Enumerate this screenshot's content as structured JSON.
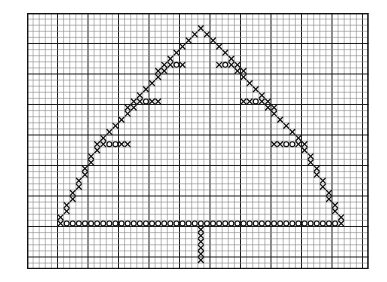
{
  "document": {
    "title": "Cross-Stitch Chart",
    "subject": "Christmas Tree",
    "medium": "graph-paper needlework chart",
    "background_color": "#ffffff"
  },
  "grid": {
    "origin_x": 27,
    "origin_y": 13,
    "cell_size": 6.1,
    "cols": 56,
    "rows": 42,
    "major_every": 5,
    "minor_color": "#8a8a8a",
    "major_color": "#1c1c1c",
    "border_color": "#111111",
    "show_border": true
  },
  "legend": {
    "symbols": [
      {
        "key": "x",
        "name": "cross-stitch-x",
        "glyph": "X",
        "color": "#0d0d0d"
      },
      {
        "key": "o",
        "name": "cross-stitch-o",
        "glyph": "O",
        "color": "#0d0d0d"
      }
    ]
  },
  "pattern": {
    "name": "christmas-tree",
    "description": "Outline of a conifer tree with zig-zag branch tiers, a stitched base row and a centered trunk.",
    "apex": {
      "col": 28,
      "row": 2
    },
    "base_row": 33,
    "base_left_col": 10,
    "base_right_col": 46,
    "trunk": {
      "col": 28,
      "top_row": 34,
      "bottom_row": 41,
      "width": 1
    },
    "cells": [
      {
        "c": 28,
        "r": 2,
        "s": "x"
      },
      {
        "c": 27,
        "r": 3,
        "s": "x"
      },
      {
        "c": 29,
        "r": 3,
        "s": "x"
      },
      {
        "c": 26,
        "r": 4,
        "s": "x"
      },
      {
        "c": 30,
        "r": 4,
        "s": "x"
      },
      {
        "c": 25,
        "r": 5,
        "s": "x"
      },
      {
        "c": 31,
        "r": 5,
        "s": "x"
      },
      {
        "c": 24,
        "r": 6,
        "s": "x"
      },
      {
        "c": 32,
        "r": 6,
        "s": "x"
      },
      {
        "c": 23,
        "r": 7,
        "s": "x"
      },
      {
        "c": 33,
        "r": 7,
        "s": "x"
      },
      {
        "c": 22,
        "r": 8,
        "s": "x"
      },
      {
        "c": 23,
        "r": 8,
        "s": "x"
      },
      {
        "c": 24,
        "r": 8,
        "s": "o"
      },
      {
        "c": 25,
        "r": 8,
        "s": "x"
      },
      {
        "c": 31,
        "r": 8,
        "s": "x"
      },
      {
        "c": 32,
        "r": 8,
        "s": "o"
      },
      {
        "c": 33,
        "r": 8,
        "s": "x"
      },
      {
        "c": 34,
        "r": 8,
        "s": "x"
      },
      {
        "c": 22,
        "r": 9,
        "s": "x"
      },
      {
        "c": 34,
        "r": 9,
        "s": "x"
      },
      {
        "c": 21,
        "r": 9,
        "s": "x"
      },
      {
        "c": 35,
        "r": 9,
        "s": "x"
      },
      {
        "c": 21,
        "r": 10,
        "s": "x"
      },
      {
        "c": 35,
        "r": 10,
        "s": "x"
      },
      {
        "c": 20,
        "r": 11,
        "s": "x"
      },
      {
        "c": 36,
        "r": 11,
        "s": "x"
      },
      {
        "c": 19,
        "r": 12,
        "s": "x"
      },
      {
        "c": 37,
        "r": 12,
        "s": "x"
      },
      {
        "c": 18,
        "r": 13,
        "s": "x"
      },
      {
        "c": 38,
        "r": 13,
        "s": "x"
      },
      {
        "c": 17,
        "r": 14,
        "s": "x"
      },
      {
        "c": 18,
        "r": 14,
        "s": "x"
      },
      {
        "c": 19,
        "r": 14,
        "s": "o"
      },
      {
        "c": 20,
        "r": 14,
        "s": "x"
      },
      {
        "c": 21,
        "r": 14,
        "s": "x"
      },
      {
        "c": 35,
        "r": 14,
        "s": "x"
      },
      {
        "c": 36,
        "r": 14,
        "s": "x"
      },
      {
        "c": 37,
        "r": 14,
        "s": "o"
      },
      {
        "c": 38,
        "r": 14,
        "s": "x"
      },
      {
        "c": 39,
        "r": 14,
        "s": "x"
      },
      {
        "c": 17,
        "r": 15,
        "s": "x"
      },
      {
        "c": 39,
        "r": 15,
        "s": "x"
      },
      {
        "c": 16,
        "r": 15,
        "s": "x"
      },
      {
        "c": 40,
        "r": 15,
        "s": "x"
      },
      {
        "c": 16,
        "r": 16,
        "s": "x"
      },
      {
        "c": 40,
        "r": 16,
        "s": "x"
      },
      {
        "c": 15,
        "r": 17,
        "s": "x"
      },
      {
        "c": 41,
        "r": 17,
        "s": "x"
      },
      {
        "c": 14,
        "r": 18,
        "s": "x"
      },
      {
        "c": 42,
        "r": 18,
        "s": "x"
      },
      {
        "c": 13,
        "r": 19,
        "s": "x"
      },
      {
        "c": 43,
        "r": 19,
        "s": "x"
      },
      {
        "c": 12,
        "r": 20,
        "s": "x"
      },
      {
        "c": 44,
        "r": 20,
        "s": "x"
      },
      {
        "c": 11,
        "r": 21,
        "s": "x"
      },
      {
        "c": 12,
        "r": 21,
        "s": "x"
      },
      {
        "c": 13,
        "r": 21,
        "s": "o"
      },
      {
        "c": 14,
        "r": 21,
        "s": "o"
      },
      {
        "c": 15,
        "r": 21,
        "s": "x"
      },
      {
        "c": 16,
        "r": 21,
        "s": "x"
      },
      {
        "c": 40,
        "r": 21,
        "s": "x"
      },
      {
        "c": 41,
        "r": 21,
        "s": "x"
      },
      {
        "c": 42,
        "r": 21,
        "s": "o"
      },
      {
        "c": 43,
        "r": 21,
        "s": "o"
      },
      {
        "c": 44,
        "r": 21,
        "s": "x"
      },
      {
        "c": 45,
        "r": 21,
        "s": "x"
      },
      {
        "c": 11,
        "r": 22,
        "s": "x"
      },
      {
        "c": 45,
        "r": 22,
        "s": "x"
      },
      {
        "c": 10,
        "r": 23,
        "s": "x"
      },
      {
        "c": 46,
        "r": 23,
        "s": "x"
      },
      {
        "c": 10,
        "r": 24,
        "s": "x"
      },
      {
        "c": 46,
        "r": 24,
        "s": "x"
      },
      {
        "c": 9,
        "r": 25,
        "s": "x"
      },
      {
        "c": 47,
        "r": 25,
        "s": "x"
      },
      {
        "c": 9,
        "r": 26,
        "s": "x"
      },
      {
        "c": 47,
        "r": 26,
        "s": "x"
      },
      {
        "c": 8,
        "r": 27,
        "s": "x"
      },
      {
        "c": 48,
        "r": 27,
        "s": "x"
      },
      {
        "c": 8,
        "r": 28,
        "s": "x"
      },
      {
        "c": 48,
        "r": 28,
        "s": "x"
      },
      {
        "c": 7,
        "r": 29,
        "s": "x"
      },
      {
        "c": 49,
        "r": 29,
        "s": "x"
      },
      {
        "c": 7,
        "r": 30,
        "s": "x"
      },
      {
        "c": 49,
        "r": 30,
        "s": "x"
      },
      {
        "c": 6,
        "r": 31,
        "s": "x"
      },
      {
        "c": 50,
        "r": 31,
        "s": "x"
      },
      {
        "c": 6,
        "r": 32,
        "s": "x"
      },
      {
        "c": 50,
        "r": 32,
        "s": "x"
      },
      {
        "c": 5,
        "r": 33,
        "s": "x"
      },
      {
        "c": 51,
        "r": 33,
        "s": "x"
      },
      {
        "c": 6,
        "r": 34,
        "s": "o"
      },
      {
        "c": 7,
        "r": 34,
        "s": "o"
      },
      {
        "c": 8,
        "r": 34,
        "s": "o"
      },
      {
        "c": 9,
        "r": 34,
        "s": "o"
      },
      {
        "c": 10,
        "r": 34,
        "s": "o"
      },
      {
        "c": 11,
        "r": 34,
        "s": "o"
      },
      {
        "c": 12,
        "r": 34,
        "s": "o"
      },
      {
        "c": 13,
        "r": 34,
        "s": "o"
      },
      {
        "c": 14,
        "r": 34,
        "s": "o"
      },
      {
        "c": 15,
        "r": 34,
        "s": "o"
      },
      {
        "c": 16,
        "r": 34,
        "s": "o"
      },
      {
        "c": 17,
        "r": 34,
        "s": "o"
      },
      {
        "c": 18,
        "r": 34,
        "s": "o"
      },
      {
        "c": 19,
        "r": 34,
        "s": "o"
      },
      {
        "c": 20,
        "r": 34,
        "s": "o"
      },
      {
        "c": 21,
        "r": 34,
        "s": "o"
      },
      {
        "c": 22,
        "r": 34,
        "s": "o"
      },
      {
        "c": 23,
        "r": 34,
        "s": "o"
      },
      {
        "c": 24,
        "r": 34,
        "s": "o"
      },
      {
        "c": 25,
        "r": 34,
        "s": "o"
      },
      {
        "c": 26,
        "r": 34,
        "s": "o"
      },
      {
        "c": 27,
        "r": 34,
        "s": "o"
      },
      {
        "c": 28,
        "r": 34,
        "s": "o"
      },
      {
        "c": 29,
        "r": 34,
        "s": "o"
      },
      {
        "c": 30,
        "r": 34,
        "s": "o"
      },
      {
        "c": 31,
        "r": 34,
        "s": "o"
      },
      {
        "c": 32,
        "r": 34,
        "s": "o"
      },
      {
        "c": 33,
        "r": 34,
        "s": "o"
      },
      {
        "c": 34,
        "r": 34,
        "s": "o"
      },
      {
        "c": 35,
        "r": 34,
        "s": "o"
      },
      {
        "c": 36,
        "r": 34,
        "s": "o"
      },
      {
        "c": 37,
        "r": 34,
        "s": "o"
      },
      {
        "c": 38,
        "r": 34,
        "s": "o"
      },
      {
        "c": 39,
        "r": 34,
        "s": "o"
      },
      {
        "c": 40,
        "r": 34,
        "s": "o"
      },
      {
        "c": 41,
        "r": 34,
        "s": "o"
      },
      {
        "c": 42,
        "r": 34,
        "s": "o"
      },
      {
        "c": 43,
        "r": 34,
        "s": "o"
      },
      {
        "c": 44,
        "r": 34,
        "s": "o"
      },
      {
        "c": 45,
        "r": 34,
        "s": "o"
      },
      {
        "c": 46,
        "r": 34,
        "s": "o"
      },
      {
        "c": 47,
        "r": 34,
        "s": "o"
      },
      {
        "c": 48,
        "r": 34,
        "s": "o"
      },
      {
        "c": 49,
        "r": 34,
        "s": "o"
      },
      {
        "c": 50,
        "r": 34,
        "s": "o"
      },
      {
        "c": 5,
        "r": 34,
        "s": "x"
      },
      {
        "c": 51,
        "r": 34,
        "s": "x"
      },
      {
        "c": 28,
        "r": 35,
        "s": "x"
      },
      {
        "c": 28,
        "r": 36,
        "s": "x"
      },
      {
        "c": 28,
        "r": 37,
        "s": "x"
      },
      {
        "c": 28,
        "r": 38,
        "s": "x"
      },
      {
        "c": 28,
        "r": 39,
        "s": "x"
      },
      {
        "c": 28,
        "r": 40,
        "s": "x"
      }
    ]
  }
}
